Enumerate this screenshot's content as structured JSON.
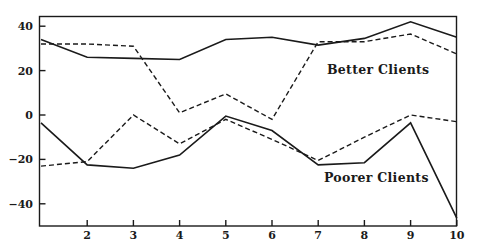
{
  "chart_data": {
    "type": "line",
    "title": "",
    "xlabel": "",
    "ylabel": "",
    "x": [
      1,
      2,
      3,
      4,
      5,
      6,
      7,
      8,
      9,
      10
    ],
    "x_tick_labels": [
      "2",
      "3",
      "4",
      "5",
      "6",
      "7",
      "8",
      "9",
      "10"
    ],
    "x_ticks": [
      2,
      3,
      4,
      5,
      6,
      7,
      8,
      9,
      10
    ],
    "y_ticks": [
      40,
      20,
      0,
      -20,
      -40
    ],
    "y_tick_labels": [
      "40",
      "20",
      "0",
      "-20",
      "-40"
    ],
    "xlim": [
      1,
      10
    ],
    "ylim": [
      -50,
      45
    ],
    "grid": false,
    "legend": "inline labels",
    "series": [
      {
        "name": "Better Clients (solid)",
        "group": "Better Clients",
        "style": "solid",
        "values": [
          34,
          26,
          25.5,
          25,
          34,
          35,
          31.5,
          34.5,
          42,
          35
        ]
      },
      {
        "name": "Better Clients (dashed)",
        "group": "Better Clients",
        "style": "dashed",
        "values": [
          32,
          32,
          31,
          1,
          9.5,
          -2,
          33,
          33,
          36.5,
          27.5
        ]
      },
      {
        "name": "Poorer Clients (solid)",
        "group": "Poorer Clients",
        "style": "solid",
        "values": [
          -3.5,
          -22.5,
          -24,
          -18,
          -0.5,
          -7,
          -22.5,
          -21.5,
          -3.5,
          -46.5
        ]
      },
      {
        "name": "Poorer Clients (dashed)",
        "group": "Poorer Clients",
        "style": "dashed",
        "values": [
          -23,
          -21,
          0,
          -13,
          -2,
          -11,
          -20.5,
          -10,
          0,
          -3
        ]
      }
    ],
    "annotations": [
      {
        "text": "Better Clients",
        "x": 8.2,
        "y": 20
      },
      {
        "text": "Poorer Clients",
        "x": 8.2,
        "y": -28
      }
    ]
  },
  "labels": {
    "better": "Better Clients",
    "poorer": "Poorer Clients"
  }
}
